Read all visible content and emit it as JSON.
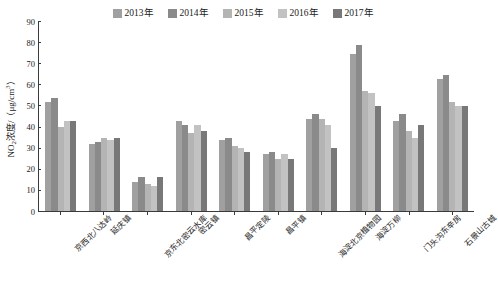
{
  "chart_data": {
    "type": "bar",
    "title": "",
    "xlabel": "",
    "ylabel": "NO₂浓度/（μg/cm³）",
    "ylabel_parts": {
      "prefix": "NO",
      "sub": "2",
      "mid": "浓度/（μg/cm",
      "sup": "3",
      "suffix": "）"
    },
    "ylim": [
      0,
      90
    ],
    "yticks": [
      0,
      10,
      20,
      30,
      40,
      50,
      60,
      70,
      80,
      90
    ],
    "grid": false,
    "legend_position": "top-center",
    "categories": [
      "京西北八达岭",
      "延庆镇",
      "京东北密云水库",
      "密云镇",
      "昌平定陵",
      "昌平镇",
      "海淀北京植物园",
      "海淀万柳",
      "门头沟东辛房",
      "石景山古城"
    ],
    "series": [
      {
        "name": "2013年",
        "color": "#a0a0a0",
        "values": [
          52,
          32,
          14,
          43,
          34,
          27,
          44,
          75,
          43,
          63
        ]
      },
      {
        "name": "2014年",
        "color": "#8a8a8a",
        "values": [
          54,
          33,
          16,
          41,
          35,
          28,
          46,
          79,
          46,
          65
        ]
      },
      {
        "name": "2015年",
        "color": "#b4b4b4",
        "values": [
          40,
          35,
          13,
          37,
          31,
          25,
          44,
          57,
          38,
          52
        ]
      },
      {
        "name": "2016年",
        "color": "#c2c2c2",
        "values": [
          43,
          34,
          12,
          41,
          30,
          27,
          41,
          56,
          35,
          50
        ]
      },
      {
        "name": "2017年",
        "color": "#787878",
        "values": [
          43,
          35,
          16,
          38,
          28,
          25,
          30,
          50,
          41,
          50
        ]
      }
    ]
  },
  "legend": {
    "items": [
      {
        "label": "2013年",
        "color": "#a0a0a0"
      },
      {
        "label": "2014年",
        "color": "#8a8a8a"
      },
      {
        "label": "2015年",
        "color": "#b4b4b4"
      },
      {
        "label": "2016年",
        "color": "#c2c2c2"
      },
      {
        "label": "2017年",
        "color": "#787878"
      }
    ]
  }
}
